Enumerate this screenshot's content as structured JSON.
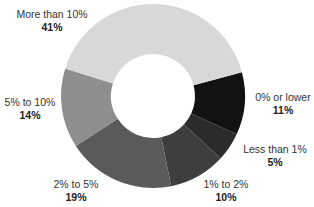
{
  "chart_data": {
    "type": "pie",
    "subtype": "donut",
    "title": "",
    "categories": [
      "0% or lower",
      "Less than 1%",
      "1% to 2%",
      "2% to 5%",
      "5% to 10%",
      "More than 10%"
    ],
    "values": [
      11,
      5,
      10,
      19,
      14,
      41
    ],
    "value_labels": [
      "11%",
      "5%",
      "10%",
      "19%",
      "14%",
      "41%"
    ],
    "colors": [
      "#121212",
      "#2b2b2b",
      "#3e3e3e",
      "#5a5a5a",
      "#8e8e8e",
      "#d8d8d8"
    ],
    "start_angle_deg": -15,
    "direction": "clockwise",
    "legend": "none (direct labels)"
  },
  "labels": [
    {
      "cat": "More than 10%",
      "pct": "41%"
    },
    {
      "cat": "0% or lower",
      "pct": "11%"
    },
    {
      "cat": "Less than 1%",
      "pct": "5%"
    },
    {
      "cat": "1% to 2%",
      "pct": "10%"
    },
    {
      "cat": "2% to 5%",
      "pct": "19%"
    },
    {
      "cat": "5% to 10%",
      "pct": "14%"
    }
  ]
}
